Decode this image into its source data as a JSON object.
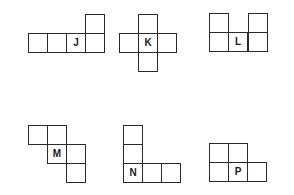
{
  "figure": {
    "cell_size": 19,
    "line_color": "#2a2a2a",
    "shapes": [
      {
        "label": "J",
        "cells": [
          {
            "x": 28,
            "y": 33,
            "label": ""
          },
          {
            "x": 47,
            "y": 33,
            "label": ""
          },
          {
            "x": 66,
            "y": 33,
            "label": "J"
          },
          {
            "x": 85,
            "y": 33,
            "label": ""
          },
          {
            "x": 85,
            "y": 14,
            "label": ""
          }
        ]
      },
      {
        "label": "K",
        "cells": [
          {
            "x": 138,
            "y": 14,
            "label": ""
          },
          {
            "x": 119,
            "y": 33,
            "label": ""
          },
          {
            "x": 138,
            "y": 33,
            "label": "K"
          },
          {
            "x": 157,
            "y": 33,
            "label": ""
          },
          {
            "x": 138,
            "y": 52,
            "label": ""
          }
        ]
      },
      {
        "label": "L",
        "cells": [
          {
            "x": 209,
            "y": 13,
            "label": ""
          },
          {
            "x": 248,
            "y": 13,
            "label": ""
          },
          {
            "x": 209,
            "y": 32,
            "label": ""
          },
          {
            "x": 228,
            "y": 32,
            "label": "L"
          },
          {
            "x": 248,
            "y": 32,
            "label": ""
          }
        ]
      },
      {
        "label": "M",
        "cells": [
          {
            "x": 28,
            "y": 125,
            "label": ""
          },
          {
            "x": 47,
            "y": 125,
            "label": ""
          },
          {
            "x": 47,
            "y": 144,
            "label": "M"
          },
          {
            "x": 66,
            "y": 144,
            "label": ""
          },
          {
            "x": 66,
            "y": 163,
            "label": ""
          }
        ]
      },
      {
        "label": "N",
        "cells": [
          {
            "x": 123,
            "y": 125,
            "label": ""
          },
          {
            "x": 123,
            "y": 144,
            "label": ""
          },
          {
            "x": 123,
            "y": 163,
            "label": "N"
          },
          {
            "x": 142,
            "y": 163,
            "label": ""
          },
          {
            "x": 161,
            "y": 163,
            "label": ""
          }
        ]
      },
      {
        "label": "P",
        "cells": [
          {
            "x": 209,
            "y": 143,
            "label": ""
          },
          {
            "x": 228,
            "y": 143,
            "label": ""
          },
          {
            "x": 209,
            "y": 162,
            "label": ""
          },
          {
            "x": 228,
            "y": 162,
            "label": "P"
          },
          {
            "x": 247,
            "y": 162,
            "label": ""
          }
        ]
      }
    ]
  }
}
